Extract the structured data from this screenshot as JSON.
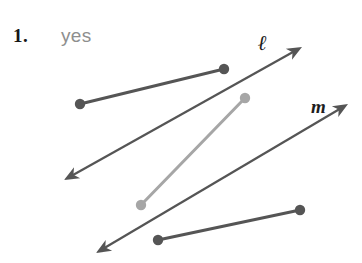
{
  "figure": {
    "width": 362,
    "height": 263,
    "background_color": "#ffffff"
  },
  "problem": {
    "number_label": "1.",
    "answer_label": "yes"
  },
  "labels": {
    "line_ell": "ℓ",
    "line_m": "m"
  },
  "colors": {
    "dark_stroke": "#555555",
    "light_stroke": "#a6a6a6",
    "number_text": "#161616",
    "answer_text": "#8e8e8e",
    "label_text": "#1d1d1d"
  },
  "geometry": {
    "lines": [
      {
        "name": "line-ell",
        "label": "ℓ",
        "color": "#555555",
        "stroke_width": 2.2,
        "arrow_start": true,
        "arrow_end": true,
        "x1": 64,
        "y1": 180,
        "x2": 302,
        "y2": 47
      },
      {
        "name": "line-m",
        "label": "m",
        "color": "#555555",
        "stroke_width": 2.2,
        "arrow_start": true,
        "arrow_end": true,
        "x1": 96,
        "y1": 253,
        "x2": 348,
        "y2": 104
      }
    ],
    "segments": [
      {
        "name": "segment-upper",
        "color": "#555555",
        "stroke_width": 3.0,
        "dot_radius": 5.2,
        "x1": 80,
        "y1": 104,
        "x2": 224,
        "y2": 69
      },
      {
        "name": "segment-transversal",
        "color": "#a6a6a6",
        "stroke_width": 3.0,
        "dot_radius": 5.2,
        "x1": 141,
        "y1": 205,
        "x2": 245,
        "y2": 98
      },
      {
        "name": "segment-lower",
        "color": "#555555",
        "stroke_width": 3.0,
        "dot_radius": 5.2,
        "x1": 158,
        "y1": 240,
        "x2": 300,
        "y2": 210
      }
    ]
  }
}
